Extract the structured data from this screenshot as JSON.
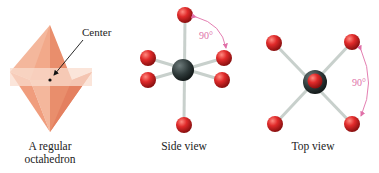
{
  "panels": [
    {
      "name": "octahedron",
      "caption_line1": "A regular",
      "caption_line2": "octahedron",
      "callout": "Center"
    },
    {
      "name": "side-view",
      "caption": "Side view",
      "angle_label": "90°"
    },
    {
      "name": "top-view",
      "caption": "Top view",
      "angle_label": "90°"
    }
  ],
  "colors": {
    "octahedron_fill": "#f2a98a",
    "octahedron_light": "#f7cdb8",
    "central_atom": "#3a4646",
    "ligand_atom": "#d82a2a",
    "bond": "#c8d0cc",
    "angle_arrow": "#e070a8"
  }
}
